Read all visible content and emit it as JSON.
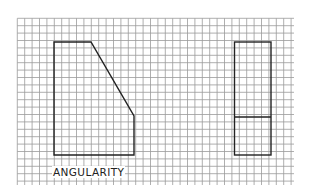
{
  "diagram": {
    "caption": "ANGULARITY",
    "grid": {
      "x0": 17.3,
      "y0": 18.3,
      "x1": 294,
      "y1": 185,
      "spacing": 7.4,
      "color": "#9a9a9a"
    },
    "front_view": {
      "name": "chamfered-block-front-view",
      "points": [
        [
          54,
          42
        ],
        [
          91,
          42
        ],
        [
          134,
          116
        ],
        [
          134,
          155
        ],
        [
          54,
          155
        ]
      ]
    },
    "side_view": {
      "name": "block-side-view",
      "x": 234.5,
      "y": 42,
      "width": 36.5,
      "height": 113,
      "divider_y": 117
    },
    "stroke_color": "#222222"
  }
}
